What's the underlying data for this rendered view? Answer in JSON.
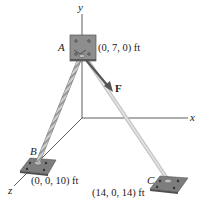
{
  "figure": {
    "axes": {
      "x_label": "x",
      "y_label": "y",
      "z_label": "z"
    },
    "points": {
      "A": {
        "label": "A",
        "coords": "(0, 7, 0) ft"
      },
      "B": {
        "label": "B",
        "coords": "(0, 0, 10) ft"
      },
      "C": {
        "label": "C",
        "coords": "(14, 0, 14) ft"
      }
    },
    "force": {
      "label": "F"
    },
    "colors": {
      "plate": "#8a8a8a",
      "plate_dark": "#5a5a5a",
      "cable": "#c9c9c9",
      "cable_stripe": "#8c8c8c",
      "force_arrow": "#555555",
      "axis": "#333333"
    }
  }
}
